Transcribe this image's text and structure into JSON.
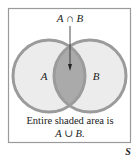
{
  "diagram": {
    "type": "venn",
    "universe_label": "S",
    "sets": [
      {
        "name": "A",
        "label": "A"
      },
      {
        "name": "B",
        "label": "B"
      }
    ],
    "intersection_label": "A ∩ B",
    "caption_line1": "Entire shaded area is",
    "caption_line2": "A ∪ B.",
    "colors": {
      "frame": "#9a9a9a",
      "circle_stroke": "#9b9b9b",
      "circle_fill": "#ececec",
      "intersection_fill": "#aaaaaa",
      "text": "#222222"
    }
  }
}
